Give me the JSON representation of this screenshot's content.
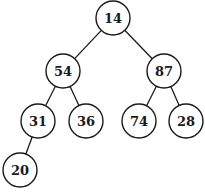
{
  "diagram": {
    "type": "binary-tree",
    "nodes": [
      {
        "id": "n0",
        "label": "14",
        "cx": 113,
        "cy": 18
      },
      {
        "id": "n1",
        "label": "54",
        "cx": 63,
        "cy": 71
      },
      {
        "id": "n2",
        "label": "87",
        "cx": 164,
        "cy": 71
      },
      {
        "id": "n3",
        "label": "31",
        "cx": 38,
        "cy": 121
      },
      {
        "id": "n4",
        "label": "36",
        "cx": 86,
        "cy": 121
      },
      {
        "id": "n5",
        "label": "74",
        "cx": 139,
        "cy": 121
      },
      {
        "id": "n6",
        "label": "28",
        "cx": 186,
        "cy": 121
      },
      {
        "id": "n7",
        "label": "20",
        "cx": 20,
        "cy": 170
      }
    ],
    "edges": [
      {
        "from": "n0",
        "to": "n1"
      },
      {
        "from": "n0",
        "to": "n2"
      },
      {
        "from": "n1",
        "to": "n3"
      },
      {
        "from": "n1",
        "to": "n4"
      },
      {
        "from": "n2",
        "to": "n5"
      },
      {
        "from": "n2",
        "to": "n6"
      },
      {
        "from": "n3",
        "to": "n7"
      }
    ],
    "node_radius": 17,
    "colors": {
      "stroke": "#1a1a1a",
      "fill": "#ffffff"
    }
  }
}
